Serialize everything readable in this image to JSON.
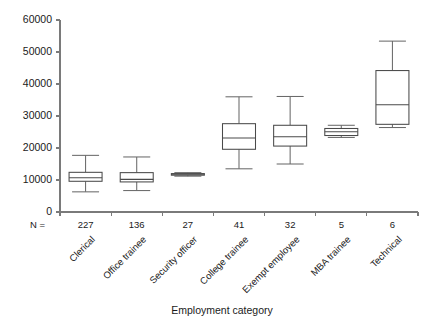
{
  "chart_data": {
    "type": "box",
    "title": "",
    "xlabel": "Employment category",
    "ylabel": "",
    "ylim": [
      0,
      60000
    ],
    "ytick_values": [
      0,
      10000,
      20000,
      30000,
      40000,
      50000,
      60000
    ],
    "ytick_labels": [
      "0",
      "10000",
      "20000",
      "30000",
      "40000",
      "50000",
      "60000"
    ],
    "grid": false,
    "legend": "none",
    "n_prefix_label": "N =",
    "categories": [
      "Clerical",
      "Office trainee",
      "Security officer",
      "College trainee",
      "Exempt employee",
      "MBA trainee",
      "Technical"
    ],
    "n_values": [
      "227",
      "136",
      "27",
      "41",
      "32",
      "5",
      "6"
    ],
    "boxes": [
      {
        "category": "Clerical",
        "n": 227,
        "whisker_low": 6300,
        "q1": 9600,
        "median": 10700,
        "q3": 12400,
        "whisker_high": 17700
      },
      {
        "category": "Office trainee",
        "n": 136,
        "whisker_low": 6700,
        "q1": 9400,
        "median": 10200,
        "q3": 12300,
        "whisker_high": 17200
      },
      {
        "category": "Security officer",
        "n": 27,
        "whisker_low": 11200,
        "q1": 11500,
        "median": 11800,
        "q3": 12000,
        "whisker_high": 12300
      },
      {
        "category": "College trainee",
        "n": 41,
        "whisker_low": 13500,
        "q1": 19600,
        "median": 23100,
        "q3": 27600,
        "whisker_high": 36000
      },
      {
        "category": "Exempt employee",
        "n": 32,
        "whisker_low": 15000,
        "q1": 20600,
        "median": 23500,
        "q3": 27100,
        "whisker_high": 36100
      },
      {
        "category": "MBA trainee",
        "n": 5,
        "whisker_low": 23300,
        "q1": 23900,
        "median": 25100,
        "q3": 26100,
        "whisker_high": 27100
      },
      {
        "category": "Technical",
        "n": 6,
        "whisker_low": 26400,
        "q1": 27400,
        "median": 33500,
        "q3": 44200,
        "whisker_high": 53400
      }
    ]
  },
  "colors": {
    "background": "#ffffff",
    "axis": "#7a7a7a",
    "box_stroke": "#4a4a4a",
    "whisker": "#6a6a6a",
    "text": "#1a1a1a"
  }
}
